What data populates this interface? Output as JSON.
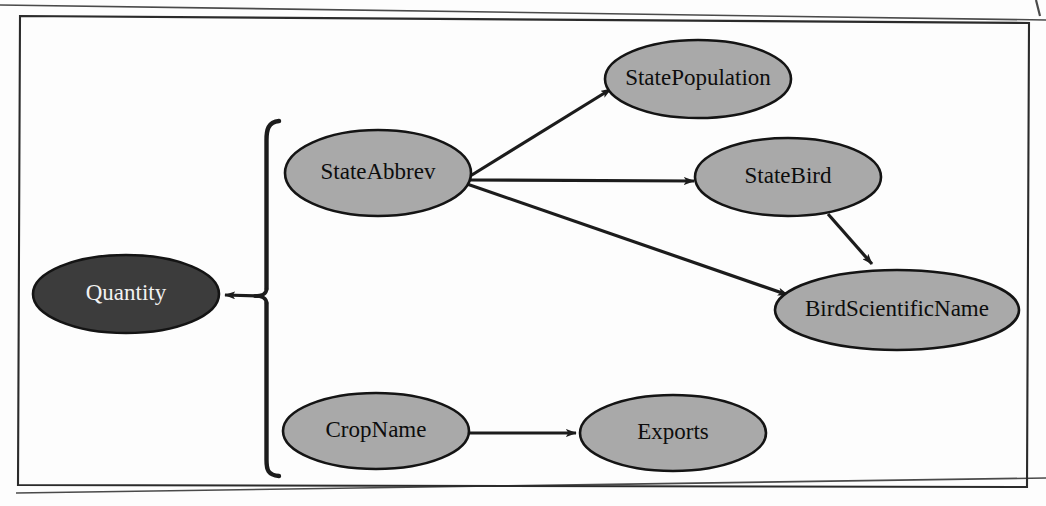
{
  "figure": {
    "kind": "functional-dependency-diagram",
    "frame": {
      "border_color": "#2b2b2b",
      "background_color": "#fdfdfd"
    },
    "palette": {
      "node_fill_light": "#a9a9a9",
      "node_fill_dark": "#3c3c3c",
      "node_stroke": "#141414",
      "edge_color": "#1c1c1c",
      "label_dark": "#0d0d0d",
      "label_light": "#f2f2f2"
    }
  },
  "nodes": [
    {
      "id": "quantity",
      "label": "Quantity",
      "cx": 126,
      "cy": 294,
      "rx": 93,
      "ry": 39,
      "fill": "dark",
      "font_size": 23
    },
    {
      "id": "state_abbrev",
      "label": "StateAbbrev",
      "cx": 378,
      "cy": 173,
      "rx": 93,
      "ry": 43,
      "fill": "light",
      "font_size": 23
    },
    {
      "id": "state_population",
      "label": "StatePopulation",
      "cx": 698,
      "cy": 79,
      "rx": 93,
      "ry": 39,
      "fill": "light",
      "font_size": 23
    },
    {
      "id": "state_bird",
      "label": "StateBird",
      "cx": 788,
      "cy": 177,
      "rx": 93,
      "ry": 39,
      "fill": "light",
      "font_size": 23
    },
    {
      "id": "bird_scientific_name",
      "label": "BirdScientificName",
      "cx": 897,
      "cy": 310,
      "rx": 122,
      "ry": 40,
      "fill": "light",
      "font_size": 23
    },
    {
      "id": "crop_name",
      "label": "CropName",
      "cx": 376,
      "cy": 431,
      "rx": 93,
      "ry": 38,
      "fill": "light",
      "font_size": 23
    },
    {
      "id": "exports",
      "label": "Exports",
      "cx": 673,
      "cy": 433,
      "rx": 93,
      "ry": 38,
      "fill": "light",
      "font_size": 23
    }
  ],
  "edges": [
    {
      "id": "edge-abbrev-to-population",
      "from": "state_abbrev",
      "to": "state_population"
    },
    {
      "id": "edge-abbrev-to-bird",
      "from": "state_abbrev",
      "to": "state_bird"
    },
    {
      "id": "edge-abbrev-to-birdsciname",
      "from": "state_abbrev",
      "to": "bird_scientific_name"
    },
    {
      "id": "edge-bird-to-birdsciname",
      "from": "state_bird",
      "to": "bird_scientific_name"
    },
    {
      "id": "edge-cropname-to-exports",
      "from": "crop_name",
      "to": "exports"
    },
    {
      "id": "edge-brace-to-quantity",
      "from": "composite-key-brace",
      "to": "quantity"
    }
  ],
  "brace": {
    "id": "composite-key-brace",
    "description": "grouping bracket joining StateAbbrev and CropName as a composite determinant",
    "x": 266,
    "top_y": 121,
    "bottom_y": 476,
    "mid_y": 296
  }
}
